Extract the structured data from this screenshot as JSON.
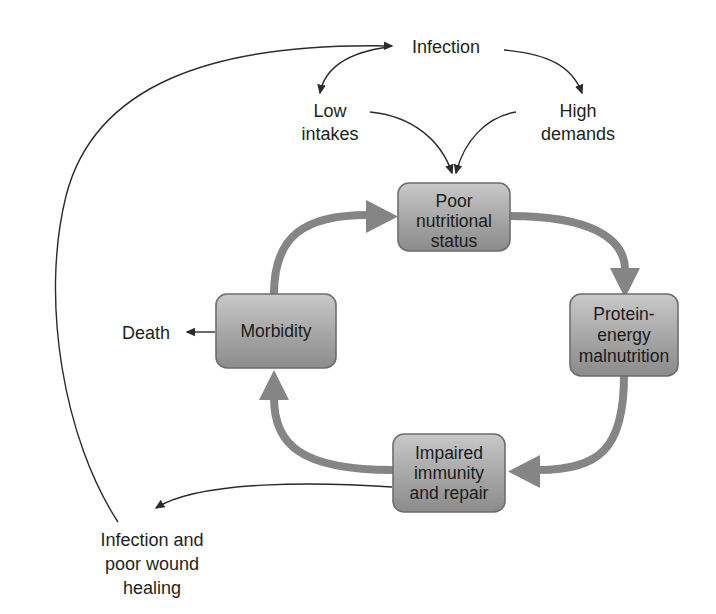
{
  "diagram": {
    "colors": {
      "background": "#ffffff",
      "box_fill_top": "#c2c2c2",
      "box_fill_bottom": "#8d8d8d",
      "box_border": "#6e6e6e",
      "cycle_arrow": "#858585",
      "thin_arrow": "#2b2b2b",
      "text": "#231f20"
    },
    "boxes": [
      {
        "id": "poor-nutritional-status",
        "lines": [
          "Poor",
          "nutritional",
          "status"
        ],
        "x": 398,
        "y": 183,
        "width": 112,
        "height": 68
      },
      {
        "id": "protein-energy-malnutrition",
        "lines": [
          "Protein-",
          "energy",
          "malnutrition"
        ],
        "x": 570,
        "y": 294,
        "width": 108,
        "height": 82
      },
      {
        "id": "impaired-immunity-and-repair",
        "lines": [
          "Impaired",
          "immunity",
          "and repair"
        ],
        "x": 393,
        "y": 434,
        "width": 112,
        "height": 78
      },
      {
        "id": "morbidity",
        "lines": [
          "Morbidity"
        ],
        "x": 216,
        "y": 294,
        "width": 120,
        "height": 74
      }
    ],
    "labels": [
      {
        "id": "infection",
        "lines": [
          "Infection"
        ],
        "x": 446,
        "y": 53,
        "align": "middle"
      },
      {
        "id": "low-intakes",
        "lines": [
          "Low",
          "intakes"
        ],
        "x": 330,
        "y": 117,
        "align": "middle"
      },
      {
        "id": "high-demands",
        "lines": [
          "High",
          "demands"
        ],
        "x": 578,
        "y": 117,
        "align": "middle"
      },
      {
        "id": "death",
        "lines": [
          "Death"
        ],
        "x": 168,
        "y": 338,
        "align": "end"
      },
      {
        "id": "infection-and-poor-wound-healing",
        "lines": [
          "Infection and",
          "poor wound",
          "healing"
        ],
        "x": 152,
        "y": 546,
        "align": "middle"
      }
    ],
    "relationships": [
      {
        "from": "infection",
        "to": "low-intakes",
        "style": "thin"
      },
      {
        "from": "infection",
        "to": "high-demands",
        "style": "thin"
      },
      {
        "from": "low-intakes",
        "to": "poor-nutritional-status",
        "style": "thin"
      },
      {
        "from": "high-demands",
        "to": "poor-nutritional-status",
        "style": "thin"
      },
      {
        "from": "poor-nutritional-status",
        "to": "protein-energy-malnutrition",
        "style": "thick"
      },
      {
        "from": "protein-energy-malnutrition",
        "to": "impaired-immunity-and-repair",
        "style": "thick"
      },
      {
        "from": "impaired-immunity-and-repair",
        "to": "morbidity",
        "style": "thick"
      },
      {
        "from": "morbidity",
        "to": "poor-nutritional-status",
        "style": "thick"
      },
      {
        "from": "morbidity",
        "to": "death",
        "style": "thin"
      },
      {
        "from": "impaired-immunity-and-repair",
        "to": "infection-and-poor-wound-healing",
        "style": "thin"
      },
      {
        "from": "infection-and-poor-wound-healing",
        "to": "infection",
        "style": "thin"
      }
    ]
  }
}
